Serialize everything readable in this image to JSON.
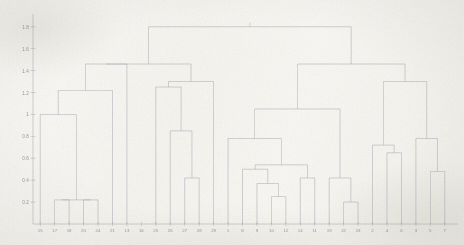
{
  "figure": {
    "kind": "scanned-dendrogram-figure",
    "background_color": "#f7f6f2",
    "line_color": "#9aa0a8",
    "text_color": "#7d8088"
  },
  "chart_data": {
    "type": "line",
    "subtype": "dendrogram",
    "title": "",
    "xlabel": "",
    "ylabel": "",
    "grid": false,
    "legend": null,
    "orientation": "vertical",
    "ylim": [
      0,
      1.88
    ],
    "yticks": [
      0.2,
      0.4,
      0.6,
      0.8,
      1,
      1.2,
      1.4,
      1.6,
      1.8
    ],
    "ytick_labels": [
      "0.2",
      "0.4",
      "0.6",
      "0.8",
      "1",
      "1.2",
      "1.4",
      "1.6",
      "1.8"
    ],
    "leaf_order": [
      "15",
      "17",
      "18",
      "20",
      "24",
      "21",
      "13",
      "16",
      "25",
      "26",
      "27",
      "28",
      "29",
      "1",
      "8",
      "9",
      "10",
      "12",
      "14",
      "11",
      "19",
      "22",
      "23",
      "2",
      "4",
      "6",
      "3",
      "5",
      "7"
    ],
    "n_leaves": 29,
    "merges": [
      {
        "id": "m1",
        "left": "17",
        "right": "18",
        "height": 0.22
      },
      {
        "id": "m2",
        "left": "20",
        "right": "24",
        "height": 0.22
      },
      {
        "id": "m3",
        "left": "m1",
        "right": "m2",
        "height": 0.22
      },
      {
        "id": "m4",
        "left": "15",
        "right": "m3",
        "height": 1.0
      },
      {
        "id": "m5",
        "left": "m4",
        "right": "21",
        "height": 1.22
      },
      {
        "id": "m6",
        "left": "m5",
        "right": "13",
        "height": 1.46
      },
      {
        "id": "m7",
        "left": "27",
        "right": "28",
        "height": 0.42
      },
      {
        "id": "m8",
        "left": "26",
        "right": "m7",
        "height": 0.85
      },
      {
        "id": "m9",
        "left": "25",
        "right": "m8",
        "height": 1.25
      },
      {
        "id": "m10",
        "left": "m9",
        "right": "29",
        "height": 1.3
      },
      {
        "id": "m11",
        "left": "m6",
        "right": "m10",
        "height": 1.46
      },
      {
        "id": "m12",
        "left": "10",
        "right": "12",
        "height": 0.25
      },
      {
        "id": "m13",
        "left": "9",
        "right": "m12",
        "height": 0.37
      },
      {
        "id": "m14",
        "left": "8",
        "right": "m13",
        "height": 0.5
      },
      {
        "id": "m15",
        "left": "14",
        "right": "11",
        "height": 0.42
      },
      {
        "id": "m16",
        "left": "m15",
        "right": "m14",
        "height": 0.54
      },
      {
        "id": "m17",
        "left": "1",
        "right": "m16",
        "height": 0.78
      },
      {
        "id": "m18",
        "left": "22",
        "right": "23",
        "height": 0.2
      },
      {
        "id": "m19",
        "left": "19",
        "right": "m18",
        "height": 0.42
      },
      {
        "id": "m20",
        "left": "m17",
        "right": "m19",
        "height": 1.05
      },
      {
        "id": "m21",
        "left": "4",
        "right": "6",
        "height": 0.65
      },
      {
        "id": "m22",
        "left": "2",
        "right": "m21",
        "height": 0.72
      },
      {
        "id": "m23",
        "left": "5",
        "right": "7",
        "height": 0.48
      },
      {
        "id": "m24",
        "left": "3",
        "right": "m23",
        "height": 0.78
      },
      {
        "id": "m25",
        "left": "m22",
        "right": "m24",
        "height": 1.3
      },
      {
        "id": "m26",
        "left": "m20",
        "right": "m25",
        "height": 1.46
      },
      {
        "id": "m27",
        "left": "m11",
        "right": "m26",
        "height": 1.8
      }
    ]
  }
}
